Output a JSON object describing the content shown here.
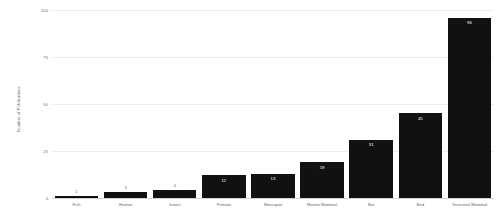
{
  "chart_data": {
    "type": "bar",
    "title": "",
    "subtitle": "",
    "xlabel": "",
    "ylabel": "Number of Publications",
    "ylim": [
      0,
      100
    ],
    "yticks": [
      0,
      25,
      50,
      75,
      100
    ],
    "ytick_labels": [
      "0",
      "25",
      "50",
      "75",
      "100"
    ],
    "grid": true,
    "legend": false,
    "legend_position": "none",
    "bar_color": "#111111",
    "gridline_color": "#ededed",
    "axis_color": "#d2d2d2",
    "label_inside_color": "#ffffff",
    "label_outside_color": "#6e6e6e",
    "categories": [
      "Fish",
      "Human",
      "Insect",
      "Primate",
      "Marsupial",
      "Marine Mammal",
      "Bat",
      "Bird",
      "Terrestrial Mammal"
    ],
    "values": [
      1,
      3,
      4,
      12,
      13,
      19,
      31,
      45,
      96
    ],
    "value_labels": [
      "1",
      "3",
      "4",
      "12",
      "13",
      "19",
      "31",
      "45",
      "96"
    ]
  }
}
